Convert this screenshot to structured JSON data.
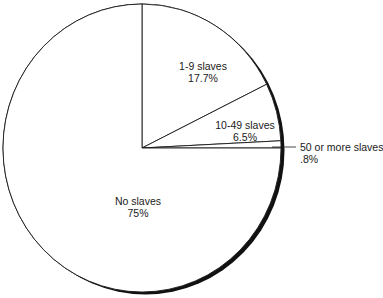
{
  "chart_data": {
    "type": "pie",
    "title": "",
    "start_angle_deg": 0,
    "direction": "clockwise",
    "slices": [
      {
        "label": "1-9 slaves",
        "value": 17.7,
        "value_label": "17.7%"
      },
      {
        "label": "10-49 slaves",
        "value": 6.5,
        "value_label": "6.5%"
      },
      {
        "label": "50 or more slaves",
        "value": 0.8,
        "value_label": ".8%"
      },
      {
        "label": "No slaves",
        "value": 75,
        "value_label": "75%"
      }
    ],
    "colors": {
      "fill": "#ffffff",
      "stroke": "#1a1a1a",
      "shadow": "#111111"
    }
  },
  "labels": {
    "slice0": {
      "name": "1-9 slaves",
      "pct": "17.7%"
    },
    "slice1": {
      "name": "10-49 slaves",
      "pct": "6.5%"
    },
    "slice2": {
      "name": "50 or more slaves",
      "pct": ".8%"
    },
    "slice3": {
      "name": "No slaves",
      "pct": "75%"
    }
  }
}
